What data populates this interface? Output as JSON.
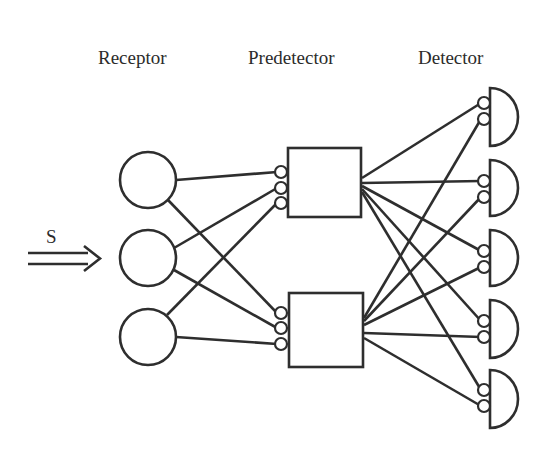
{
  "labels": {
    "receptor": "Receptor",
    "predetector": "Predetector",
    "detector": "Detector",
    "input": "S"
  },
  "layers": {
    "receptor": {
      "count": 3,
      "shape": "circle"
    },
    "predetector": {
      "count": 2,
      "shape": "square",
      "inputs_per_unit": 3
    },
    "detector": {
      "count": 5,
      "shape": "half-circle",
      "inputs_per_unit": 2
    }
  },
  "connections": {
    "receptor_to_predetector": [
      {
        "from": "R1",
        "to": "P1",
        "synapse": 1
      },
      {
        "from": "R2",
        "to": "P1",
        "synapse": 2
      },
      {
        "from": "R3",
        "to": "P1",
        "synapse": 3
      },
      {
        "from": "R1",
        "to": "P2",
        "synapse": 1
      },
      {
        "from": "R2",
        "to": "P2",
        "synapse": 2
      },
      {
        "from": "R3",
        "to": "P2",
        "synapse": 3
      }
    ],
    "predetector_to_detector": [
      {
        "from": "P1",
        "to": "D1"
      },
      {
        "from": "P1",
        "to": "D2"
      },
      {
        "from": "P1",
        "to": "D3"
      },
      {
        "from": "P1",
        "to": "D4"
      },
      {
        "from": "P1",
        "to": "D5"
      },
      {
        "from": "P2",
        "to": "D1"
      },
      {
        "from": "P2",
        "to": "D2"
      },
      {
        "from": "P2",
        "to": "D3"
      },
      {
        "from": "P2",
        "to": "D4"
      },
      {
        "from": "P2",
        "to": "D5"
      }
    ]
  },
  "colors": {
    "line": "#2e2e2e",
    "background": "#ffffff"
  }
}
